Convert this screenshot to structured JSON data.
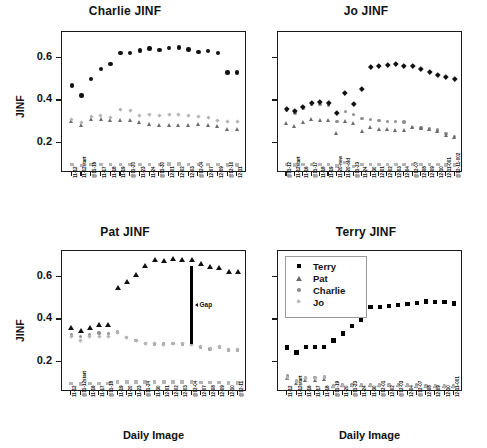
{
  "figure": {
    "xlabel": "Daily Image",
    "ylabel": "JINF",
    "yticks": [
      "0.2",
      "0.4",
      "0.6"
    ],
    "ylim": [
      0.06,
      0.72
    ],
    "annotation": {
      "gap_label": "Gap"
    },
    "colors": {
      "terry": "#000000",
      "pat": "#6b6b6b",
      "charlie": "#8f8f8f",
      "jo": "#b5b5b5",
      "axis": "#1a1a1a"
    }
  },
  "legend": {
    "position": "top-left-of-terry-panel",
    "entries": [
      {
        "label": "Terry",
        "marker": "square",
        "color": "#000000"
      },
      {
        "label": "Pat",
        "marker": "triangle",
        "color": "#6b6b6b"
      },
      {
        "label": "Charlie",
        "marker": "circle",
        "color": "#8f8f8f"
      },
      {
        "label": "Jo",
        "marker": "diamond",
        "color": "#b5b5b5"
      }
    ]
  },
  "chart_data": [
    {
      "type": "scatter",
      "title": "Charlie JINF",
      "xlabel": "",
      "ylabel": "JINF",
      "ylim": [
        0.06,
        0.72
      ],
      "yticks": [
        0.2,
        0.4,
        0.6
      ],
      "grid": false,
      "categories": [
        "11-12",
        "11-12start",
        "@11-16",
        "11-17",
        "11-18",
        "11-19",
        "@11-20",
        "11-23",
        "11-24",
        "@11-30",
        "12-01",
        "12-02",
        "12-03",
        "@12-04",
        "12-07",
        "12-09",
        "@12-10",
        "12-11"
      ],
      "series": [
        {
          "name": "Charlie",
          "marker": "circle-dark",
          "values": [
            0.47,
            0.422,
            0.501,
            0.546,
            0.57,
            0.622,
            0.622,
            0.634,
            0.642,
            0.636,
            0.644,
            0.648,
            0.638,
            0.626,
            0.631,
            0.622,
            0.53,
            0.53
          ]
        },
        {
          "name": "Pat",
          "marker": "triangle",
          "values": [
            0.302,
            0.283,
            0.312,
            0.311,
            0.308,
            0.309,
            0.307,
            0.299,
            0.29,
            0.284,
            0.285,
            0.286,
            0.285,
            0.289,
            0.284,
            0.279,
            0.268,
            0.268
          ]
        },
        {
          "name": "Jo",
          "marker": "diamond",
          "values": [
            0.312,
            0.298,
            0.325,
            0.33,
            0.322,
            0.359,
            0.352,
            0.33,
            0.334,
            0.33,
            0.334,
            0.336,
            0.33,
            0.325,
            0.318,
            0.308,
            0.302,
            0.301
          ]
        },
        {
          "name": "Terry",
          "marker": "square",
          "values": [
            0.1,
            0.096,
            0.1,
            0.1,
            0.1,
            0.1,
            0.1,
            0.1,
            0.1,
            0.1,
            0.101,
            0.101,
            0.1,
            0.1,
            0.1,
            0.1,
            0.098,
            0.098
          ]
        }
      ]
    },
    {
      "type": "scatter",
      "title": "Jo JINF",
      "xlabel": "",
      "ylabel": "",
      "ylim": [
        0.06,
        0.72
      ],
      "yticks": [
        0.2,
        0.4,
        0.6
      ],
      "grid": false,
      "categories": [
        "@11-12",
        "11-12start",
        "11-16",
        "@11-17",
        "11-18",
        "11-19",
        "11-20-new",
        "11-20-old",
        "@11-23",
        "11-24",
        "11-30",
        "12-01",
        "12-02",
        "12-03",
        "12-04",
        "@12-07",
        "12-08",
        "12-09",
        "12-10",
        "12-11-001",
        "@12-11-002"
      ],
      "series": [
        {
          "name": "Jo",
          "marker": "diamond-dark",
          "values": [
            0.361,
            0.352,
            0.372,
            0.39,
            0.392,
            0.388,
            0.341,
            0.434,
            0.385,
            0.455,
            0.557,
            0.561,
            0.566,
            0.572,
            0.563,
            0.56,
            0.549,
            0.532,
            0.519,
            0.512,
            0.5
          ]
        },
        {
          "name": "Charlie",
          "marker": "circle",
          "values": [
            0.352,
            0.341,
            0.362,
            0.381,
            0.381,
            0.379,
            0.302,
            0.347,
            0.334,
            0.316,
            0.31,
            0.305,
            0.302,
            0.3,
            0.298,
            0.272,
            0.271,
            0.268,
            0.262,
            0.246,
            0.232
          ]
        },
        {
          "name": "Pat",
          "marker": "triangle",
          "values": [
            0.296,
            0.278,
            0.3,
            0.311,
            0.31,
            0.309,
            0.245,
            0.302,
            0.292,
            0.258,
            0.275,
            0.268,
            0.265,
            0.262,
            0.26,
            0.276,
            0.272,
            0.266,
            0.258,
            0.239,
            0.229
          ]
        },
        {
          "name": "Terry",
          "marker": "square",
          "values": [
            0.1,
            0.098,
            0.099,
            0.1,
            0.1,
            0.1,
            0.093,
            0.11,
            0.091,
            0.1,
            0.1,
            0.1,
            0.1,
            0.1,
            0.1,
            0.1,
            0.1,
            0.1,
            0.099,
            0.098,
            0.098
          ]
        }
      ]
    },
    {
      "type": "scatter",
      "title": "Pat JINF",
      "xlabel": "Daily Image",
      "ylabel": "JINF",
      "ylim": [
        0.06,
        0.72
      ],
      "yticks": [
        0.2,
        0.4,
        0.6
      ],
      "grid": false,
      "annotations": [
        {
          "text": "Gap",
          "x_index": 13,
          "y_from": 0.285,
          "y_to": 0.648
        }
      ],
      "categories": [
        "11-12",
        "@11-12start",
        "11-16",
        "11-17",
        "@11-18",
        "11-19",
        "11-20",
        "11-23",
        "@11-24",
        "11-30",
        "12-01",
        "12-02",
        "12-03",
        "@12-04",
        "12-07",
        "12-08",
        "12-09",
        "12-10",
        "@12-11"
      ],
      "series": [
        {
          "name": "Pat",
          "marker": "triangle-dark",
          "values": [
            0.362,
            0.348,
            0.36,
            0.374,
            0.374,
            0.549,
            0.578,
            0.609,
            0.651,
            0.678,
            0.675,
            0.683,
            0.682,
            0.682,
            0.661,
            0.645,
            0.643,
            0.625,
            0.622
          ]
        },
        {
          "name": "Charlie",
          "marker": "circle",
          "values": [
            0.33,
            0.321,
            0.328,
            0.337,
            0.335,
            0.34,
            0.315,
            0.3,
            0.287,
            0.285,
            0.284,
            0.288,
            0.285,
            0.282,
            0.27,
            0.262,
            0.27,
            0.256,
            0.256
          ]
        },
        {
          "name": "Jo",
          "marker": "diamond",
          "values": [
            0.318,
            0.3,
            0.32,
            0.321,
            0.32,
            0.341,
            0.315,
            0.301,
            0.288,
            0.285,
            0.284,
            0.288,
            0.285,
            0.282,
            0.272,
            0.264,
            0.272,
            0.258,
            0.258
          ]
        },
        {
          "name": "Terry",
          "marker": "square",
          "values": [
            0.1,
            0.097,
            0.1,
            0.1,
            0.1,
            0.108,
            0.107,
            0.107,
            0.107,
            0.107,
            0.107,
            0.107,
            0.107,
            0.107,
            0.105,
            0.104,
            0.104,
            0.103,
            0.103
          ]
        }
      ]
    },
    {
      "type": "scatter",
      "title": "Terry JINF",
      "xlabel": "Daily Image",
      "ylabel": "",
      "ylim": [
        0.06,
        0.72
      ],
      "yticks": [
        0.2,
        0.4,
        0.6
      ],
      "grid": false,
      "categories": [
        "11-12",
        "11-12start",
        "11-16",
        "11-17",
        "11-18",
        "@11-19",
        "11-20",
        "@11-23",
        "11-24",
        "11-30",
        "@12-01",
        "12-02",
        "@12-03",
        "12-04",
        "@12-07",
        "12-08",
        "12-09",
        "12-10",
        "12-11-001"
      ],
      "series": [
        {
          "name": "Terry",
          "marker": "square-dark",
          "values": [
            0.268,
            0.245,
            0.272,
            0.271,
            0.269,
            0.301,
            0.334,
            0.369,
            0.396,
            0.456,
            0.456,
            0.462,
            0.466,
            0.47,
            0.476,
            0.484,
            0.48,
            0.48,
            0.474
          ]
        },
        {
          "name": "Pat",
          "marker": "triangle",
          "values": [
            0.124,
            0.102,
            0.118,
            0.118,
            0.121,
            0.089,
            0.092,
            0.093,
            0.093,
            0.093,
            0.093,
            0.093,
            0.093,
            0.093,
            0.09,
            0.088,
            0.088,
            0.086,
            0.086
          ]
        },
        {
          "name": "Charlie",
          "marker": "circle",
          "values": [
            0.134,
            0.112,
            0.128,
            0.128,
            0.131,
            0.09,
            0.094,
            0.095,
            0.095,
            0.095,
            0.095,
            0.095,
            0.095,
            0.095,
            0.092,
            0.09,
            0.09,
            0.088,
            0.088
          ]
        },
        {
          "name": "Jo",
          "marker": "diamond",
          "values": [
            0.128,
            0.108,
            0.124,
            0.124,
            0.127,
            0.086,
            0.089,
            0.09,
            0.09,
            0.09,
            0.09,
            0.09,
            0.09,
            0.09,
            0.088,
            0.086,
            0.086,
            0.084,
            0.084
          ]
        }
      ]
    }
  ]
}
